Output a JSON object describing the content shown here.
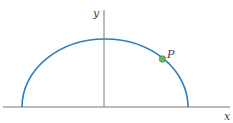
{
  "diagram": {
    "axes": {
      "x_label": "x",
      "y_label": "y"
    },
    "curve": {
      "type": "semi-ellipse",
      "color": "#2a7fc0"
    },
    "point": {
      "label": "P",
      "color": "#5aa84a"
    }
  }
}
